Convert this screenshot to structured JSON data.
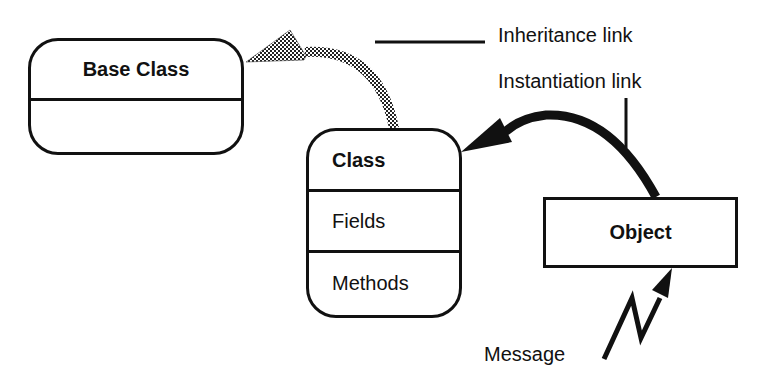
{
  "diagram": {
    "base_class": {
      "title": "Base Class",
      "body": ""
    },
    "class": {
      "title": "Class",
      "fields": "Fields",
      "methods": "Methods"
    },
    "object": {
      "title": "Object"
    },
    "legend": {
      "inheritance_link": "Inheritance link",
      "instantiation_link": "Instantiation link"
    },
    "message_label": "Message",
    "colors": {
      "stroke": "#111111",
      "background": "#ffffff",
      "inheritance_fill": "#6b6b6b"
    }
  }
}
